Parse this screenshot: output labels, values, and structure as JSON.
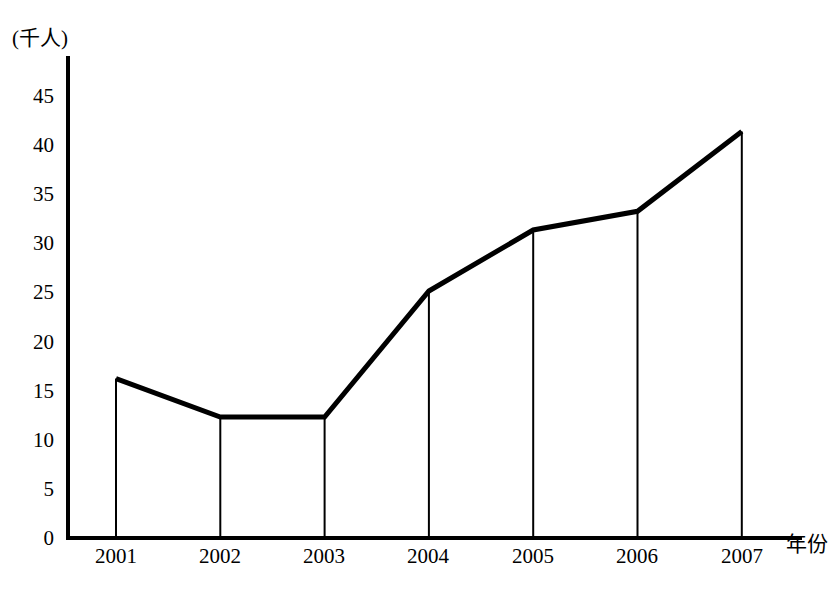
{
  "chart_data": {
    "type": "line",
    "title": "",
    "subtitle": "",
    "xlabel": "年份",
    "ylabel": "(千人)",
    "categories": [
      "2001",
      "2002",
      "2003",
      "2004",
      "2005",
      "2006",
      "2007"
    ],
    "values": [
      16.2,
      12.3,
      12.3,
      25.1,
      31.3,
      33.2,
      41.3
    ],
    "series": [
      {
        "name": "",
        "values": [
          16.2,
          12.3,
          12.3,
          25.1,
          31.3,
          33.2,
          41.3
        ]
      }
    ],
    "ylim": [
      0,
      47
    ],
    "xlim": [
      "2001",
      "2007"
    ],
    "yticks": [
      0,
      5,
      10,
      15,
      20,
      25,
      30,
      35,
      40,
      45
    ],
    "ytick_labels": [
      "0",
      "5",
      "10",
      "15",
      "20",
      "25",
      "30",
      "35",
      "40",
      "45"
    ],
    "xtick_labels": [
      "2001",
      "2002",
      "2003",
      "2004",
      "2005",
      "2006",
      "2007"
    ],
    "grid": false,
    "legend": false,
    "legend_position": "none",
    "drop_lines": true,
    "annotations": [],
    "line_color": "#000000",
    "axis_color": "#000000",
    "background_color": "#ffffff"
  },
  "axes": {
    "y_unit_label": "(千人)",
    "x_name_label": "年份"
  }
}
